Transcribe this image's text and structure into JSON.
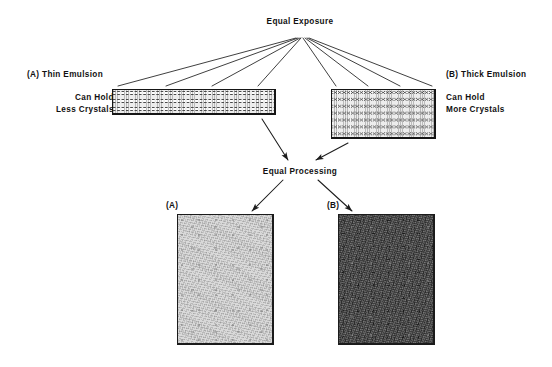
{
  "figure": {
    "caption_absent": true,
    "background_color": "#ffffff",
    "ink_color": "#111111"
  },
  "titles": {
    "exposure": "Equal Exposure",
    "processing": "Equal Processing"
  },
  "left_branch": {
    "heading": "(A)  Thin Emulsion",
    "sub_line_1": "Can Hold",
    "sub_line_2": "Less Crystals",
    "emulsion": {
      "name": "thin-emulsion-cross-section",
      "crystal_rows": 3,
      "crystal_columns": 38,
      "fill_color": "#f2f2f2",
      "border_color": "#151515"
    },
    "result": {
      "label": "(A)",
      "density": "low",
      "tone_color": "#d9d9d9"
    }
  },
  "right_branch": {
    "heading": "(B)  Thick Emulsion",
    "sub_line_1": "Can Hold",
    "sub_line_2": "More Crystals",
    "emulsion": {
      "name": "thick-emulsion-cross-section",
      "crystal_rows": 7,
      "crystal_columns": 24,
      "fill_color": "#f2f2f2",
      "border_color": "#151515"
    },
    "result": {
      "label": "(B)",
      "density": "high",
      "tone_color": "#3f3f3f"
    }
  },
  "connectors": {
    "exposure_fan_ray_count": 8,
    "exposure_fan_origin": {
      "x": 300,
      "y": 38
    },
    "arrows_into_processing": 2,
    "arrows_out_of_processing": 2,
    "line_color": "#1d1d1d"
  }
}
